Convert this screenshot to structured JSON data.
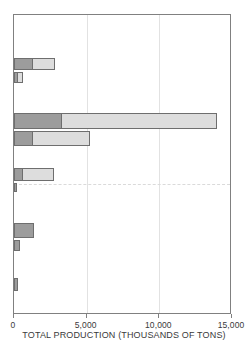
{
  "chart_data": {
    "type": "bar",
    "orientation": "horizontal",
    "stacked": true,
    "title": "",
    "subtitle": "",
    "xlabel": "TOTAL PRODUCTION (THOUSANDS OF TONS)",
    "ylabel": "",
    "xlim": [
      0,
      15000
    ],
    "ylim": [
      0,
      10
    ],
    "xticks": [
      0,
      5000,
      10000,
      15000
    ],
    "xtick_labels": [
      "0",
      "5,000",
      "10,000",
      "15,000"
    ],
    "yticks": [],
    "ytick_labels": [],
    "grid": "vertical gridlines at 5,000 and 10,000; single dashed horizontal reference line",
    "legend": null,
    "legend_position": "none",
    "colors": {
      "series_1": "#9c9c9c",
      "series_2": "#dddddd",
      "bar_outline": "#6e6e6e",
      "axis": "#808080",
      "gridline": "#e2e2e2",
      "dashed_reference_line": "#dadada",
      "text": "#3a3a3a"
    },
    "series": [
      {
        "name": "series-1-dark",
        "color": "#9c9c9c",
        "values": [
          1300,
          300,
          3300,
          1300,
          600,
          200,
          1350,
          400,
          250
        ]
      },
      {
        "name": "series-2-light",
        "color": "#dddddd",
        "values": [
          1500,
          300,
          10700,
          3950,
          2150,
          0,
          0,
          0,
          0
        ]
      }
    ],
    "totals": [
      2800,
      600,
      14000,
      5250,
      2750,
      200,
      1350,
      400,
      250
    ],
    "groups": [
      {
        "index": 0,
        "bars": [
          {
            "dark": 1300,
            "light": 1500,
            "total": 2800
          },
          {
            "dark": 300,
            "light": 300,
            "total": 600
          }
        ]
      },
      {
        "index": 1,
        "bars": [
          {
            "dark": 3300,
            "light": 10700,
            "total": 14000
          },
          {
            "dark": 1300,
            "light": 3950,
            "total": 5250
          }
        ]
      },
      {
        "index": 2,
        "bars": [
          {
            "dark": 600,
            "light": 2150,
            "total": 2750
          },
          {
            "dark": 200,
            "light": 0,
            "total": 200
          }
        ]
      },
      {
        "index": 3,
        "bars": [
          {
            "dark": 1350,
            "light": 0,
            "total": 1350
          },
          {
            "dark": 400,
            "light": 0,
            "total": 400
          }
        ]
      },
      {
        "index": 4,
        "bars": [
          {
            "dark": 250,
            "light": 0,
            "total": 250
          }
        ]
      }
    ],
    "annotations": []
  },
  "axis": {
    "title": "TOTAL PRODUCTION (THOUSANDS OF TONS)",
    "tick_labels": [
      "0",
      "5,000",
      "10,000",
      "15,000"
    ]
  }
}
